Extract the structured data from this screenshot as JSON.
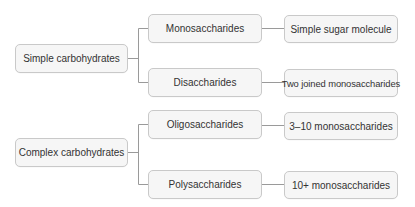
{
  "diagram": {
    "type": "tree",
    "colors": {
      "node_fill": "#f6f6f6",
      "node_border": "#c9c9c9",
      "connector": "#9a9a9a",
      "text": "#333333"
    },
    "groups": [
      {
        "root": "Simple carbohydrates",
        "children": [
          {
            "label": "Monosaccharides",
            "description": "Simple sugar molecule"
          },
          {
            "label": "Disaccharides",
            "description": "Two joined monosaccharides"
          }
        ]
      },
      {
        "root": "Complex carbohydrates",
        "children": [
          {
            "label": "Oligosaccharides",
            "description": "3–10 monosaccharides"
          },
          {
            "label": "Polysaccharides",
            "description": "10+ monosaccharides"
          }
        ]
      }
    ]
  }
}
